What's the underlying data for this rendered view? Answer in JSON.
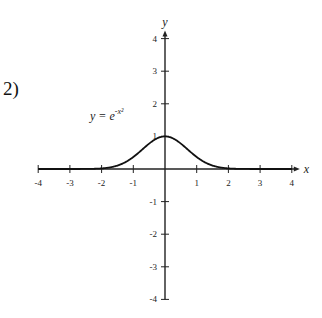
{
  "problem_number": "2)",
  "equation": {
    "lhs": "y",
    "eq": " = ",
    "base": "e",
    "exponent": "-x²"
  },
  "chart_data": {
    "type": "line",
    "title": "",
    "xlabel": "x",
    "ylabel": "y",
    "xlim": [
      -4,
      4
    ],
    "ylim": [
      -4,
      4
    ],
    "x_ticks": [
      -4,
      -3,
      -2,
      -1,
      1,
      2,
      3,
      4
    ],
    "y_ticks": [
      -4,
      -3,
      -2,
      -1,
      1,
      2,
      3,
      4
    ],
    "grid": false,
    "series": [
      {
        "name": "y = e^(-x^2)",
        "function": "exp(-x^2)",
        "x": [
          -4,
          -3,
          -2,
          -1.5,
          -1,
          -0.5,
          0,
          0.5,
          1,
          1.5,
          2,
          3,
          4
        ],
        "y": [
          0.0,
          0.0001,
          0.018,
          0.105,
          0.368,
          0.779,
          1.0,
          0.779,
          0.368,
          0.105,
          0.018,
          0.0001,
          0.0
        ]
      }
    ],
    "annotations": [
      {
        "text": "y = e^(-x²)",
        "near": [
          -1.7,
          1.5
        ]
      }
    ]
  }
}
